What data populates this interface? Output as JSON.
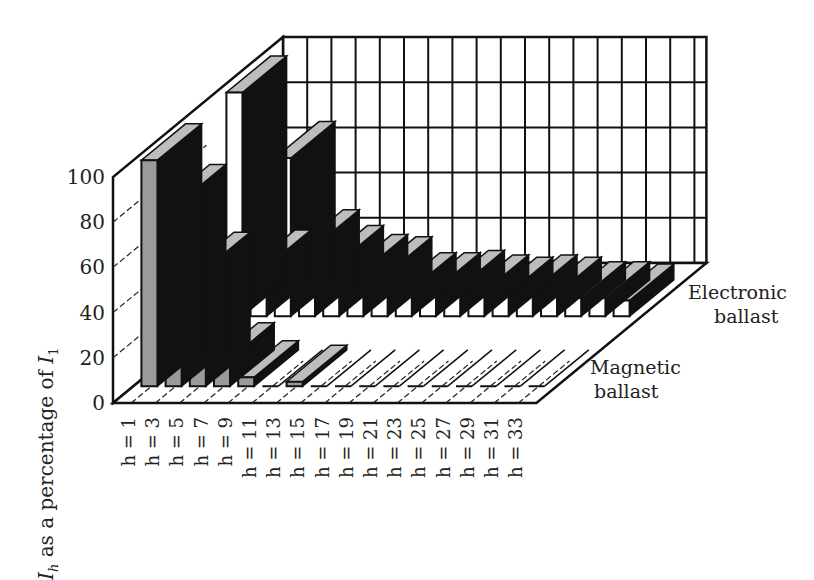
{
  "chart_data": {
    "type": "bar",
    "subtype": "3d-grouped-depth",
    "title": "",
    "ylabel": "I_h as a percentage of I_1",
    "ylabel_parts": {
      "sym": "I",
      "sub": "h",
      "mid": " as a percentage of ",
      "sym2": "I",
      "sub2": "1"
    },
    "xlabel": "",
    "ylim": [
      0,
      100
    ],
    "yticks": [
      0,
      20,
      40,
      60,
      80,
      100
    ],
    "categories": [
      "h = 1",
      "h = 3",
      "h = 5",
      "h = 7",
      "h = 9",
      "h = 11",
      "h = 13",
      "h = 15",
      "h = 17",
      "h = 19",
      "h = 21",
      "h = 23",
      "h = 25",
      "h = 27",
      "h = 29",
      "h = 31",
      "h = 33"
    ],
    "series": [
      {
        "name": "Magnetic ballast",
        "label_line1": "Magnetic",
        "label_line2": "ballast",
        "color": "#9a9a9a",
        "values": [
          100,
          82,
          52,
          12,
          4,
          0,
          2,
          0,
          0,
          0,
          0,
          0,
          0,
          0,
          0,
          0,
          0
        ]
      },
      {
        "name": "Electronic ballast",
        "label_line1": "Electronic",
        "label_line2": "ballast",
        "color": "#ffffff",
        "values": [
          99,
          22,
          70,
          31,
          24,
          20,
          19,
          12,
          12,
          13,
          11,
          10,
          11,
          10,
          8,
          8,
          7
        ]
      }
    ],
    "grid": true,
    "legend": "inline-right"
  }
}
